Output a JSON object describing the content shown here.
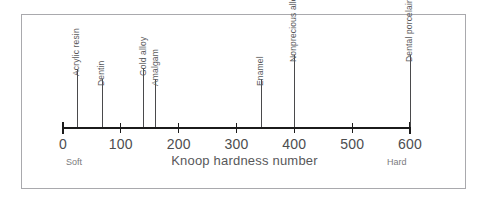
{
  "figure": {
    "axis_title": "Knoop hardness number",
    "soft_label": "Soft",
    "hard_label": "Hard",
    "border_color": "#a9a9ad",
    "axis_color": "#1b1b1b",
    "marker_color": "#5a5a5c"
  },
  "chart_data": {
    "type": "scatter",
    "title": "",
    "xlabel": "Knoop hardness number",
    "ylabel": "",
    "xlim": [
      0,
      600
    ],
    "xticks": [
      0,
      100,
      200,
      300,
      400,
      500,
      600
    ],
    "xtick_labels": [
      "0",
      "100",
      "200",
      "300",
      "400",
      "500",
      "600"
    ],
    "grid": false,
    "legend": "none",
    "annotations": [
      "Soft",
      "Hard"
    ],
    "categories": [
      "Acrylic resin",
      "Dentin",
      "Gold alloy",
      "Amalgam",
      "Enamel",
      "Nonprecious alloy",
      "Dental porcelain"
    ],
    "values": [
      25,
      68,
      140,
      160,
      343,
      400,
      600
    ],
    "points": [
      {
        "label": "Acrylic resin",
        "value": 25,
        "stem": 58
      },
      {
        "label": "Dentin",
        "value": 68,
        "stem": 48
      },
      {
        "label": "Gold alloy",
        "value": 140,
        "stem": 58
      },
      {
        "label": "Amalgam",
        "value": 160,
        "stem": 48
      },
      {
        "label": "Enamel",
        "value": 343,
        "stem": 48
      },
      {
        "label": "Nonprecious alloy",
        "value": 400,
        "stem": 72
      },
      {
        "label": "Dental porcelain",
        "value": 600,
        "stem": 72
      }
    ]
  }
}
